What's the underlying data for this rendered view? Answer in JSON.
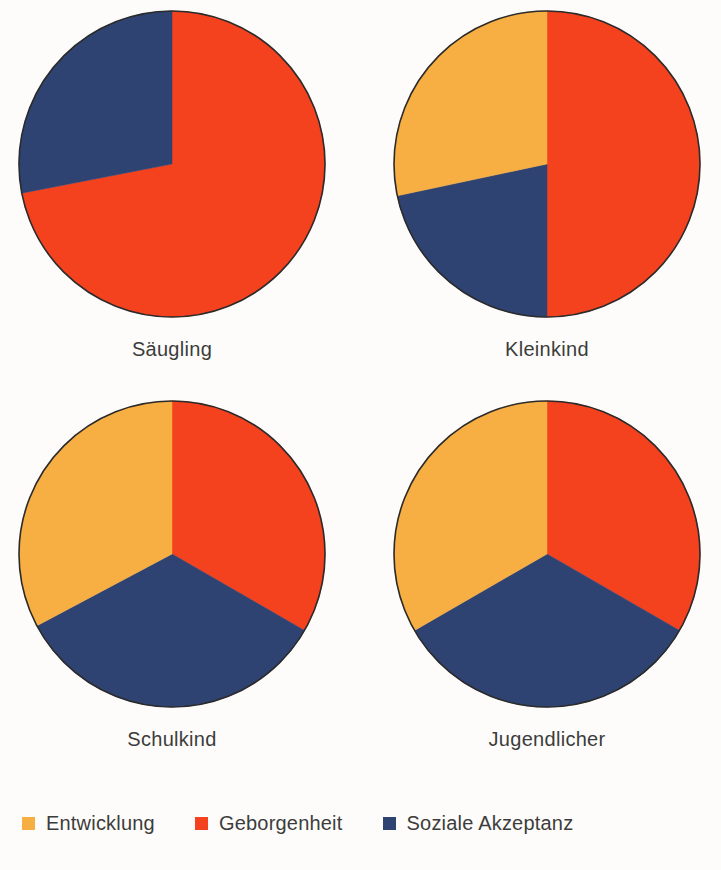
{
  "chart_data": {
    "type": "pie",
    "title": "",
    "subtitle": "",
    "xlabel": "",
    "ylabel": "",
    "legend_position": "bottom-left",
    "grid": false,
    "units": "percent",
    "start_angle_deg": 0,
    "direction": "clockwise",
    "legend": [
      {
        "name": "Entwicklung",
        "color": "#f7ae43"
      },
      {
        "name": "Geborgenheit",
        "color": "#f4411e"
      },
      {
        "name": "Soziale Akzeptanz",
        "color": "#2e4372"
      }
    ],
    "categories": [
      "Entwicklung",
      "Geborgenheit",
      "Soziale Akzeptanz"
    ],
    "colors": [
      "#f7ae43",
      "#f4411e",
      "#2e4372"
    ],
    "panels": [
      {
        "label": "Säugling",
        "values": [
          0,
          72,
          28
        ],
        "slices": [
          {
            "name": "Geborgenheit",
            "value": 72,
            "color": "#f4411e",
            "start_deg": 0,
            "end_deg": 259
          },
          {
            "name": "Soziale Akzeptanz",
            "value": 28,
            "color": "#2e4372",
            "start_deg": 259,
            "end_deg": 360
          }
        ]
      },
      {
        "label": "Kleinkind",
        "values": [
          28,
          50,
          22
        ],
        "slices": [
          {
            "name": "Geborgenheit",
            "value": 50,
            "color": "#f4411e",
            "start_deg": 0,
            "end_deg": 180
          },
          {
            "name": "Soziale Akzeptanz",
            "value": 22,
            "color": "#2e4372",
            "start_deg": 180,
            "end_deg": 258
          },
          {
            "name": "Entwicklung",
            "value": 28,
            "color": "#f7ae43",
            "start_deg": 258,
            "end_deg": 360
          }
        ]
      },
      {
        "label": "Schulkind",
        "values": [
          34,
          33,
          33
        ],
        "slices": [
          {
            "name": "Geborgenheit",
            "value": 33,
            "color": "#f4411e",
            "start_deg": 0,
            "end_deg": 120
          },
          {
            "name": "Soziale Akzeptanz",
            "value": 33,
            "color": "#2e4372",
            "start_deg": 120,
            "end_deg": 242
          },
          {
            "name": "Entwicklung",
            "value": 34,
            "color": "#f7ae43",
            "start_deg": 242,
            "end_deg": 360
          }
        ]
      },
      {
        "label": "Jugendlicher",
        "values": [
          33,
          33,
          34
        ],
        "slices": [
          {
            "name": "Geborgenheit",
            "value": 33,
            "color": "#f4411e",
            "start_deg": 0,
            "end_deg": 120
          },
          {
            "name": "Soziale Akzeptanz",
            "value": 34,
            "color": "#2e4372",
            "start_deg": 120,
            "end_deg": 240
          },
          {
            "name": "Entwicklung",
            "value": 33,
            "color": "#f7ae43",
            "start_deg": 240,
            "end_deg": 360
          }
        ]
      }
    ]
  },
  "style": {
    "background": "#fdfcfa",
    "outline": "#2b2b2b",
    "text": "#3c3c3c"
  }
}
